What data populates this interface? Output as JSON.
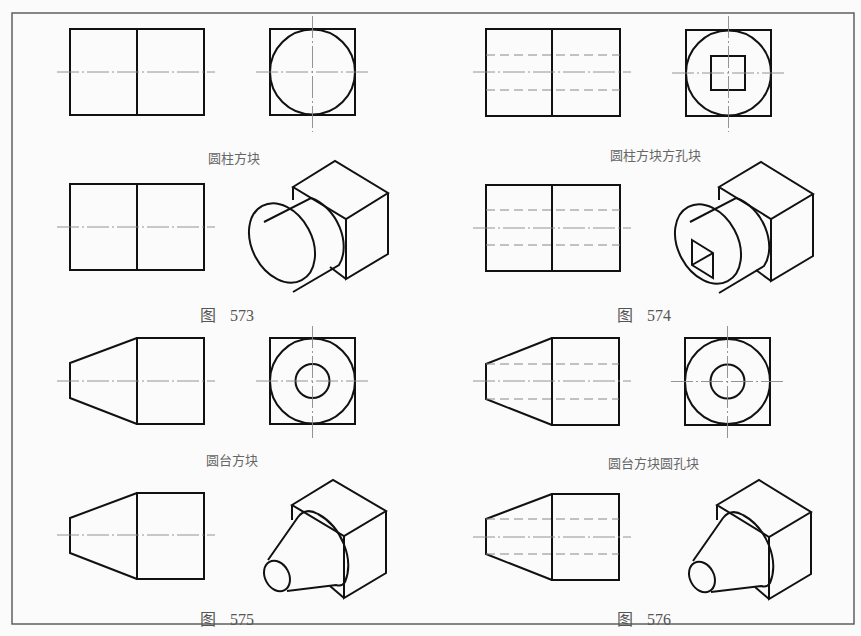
{
  "sheet": {
    "colors": {
      "object_line": "#111111",
      "center_line": "#888888",
      "hidden_line": "#888888",
      "frame": "#555555",
      "caption": "#666666"
    }
  },
  "panels": [
    {
      "id": "573-views",
      "caption": "圆柱方块"
    },
    {
      "id": "574-views",
      "caption": "圆柱方块方孔块"
    },
    {
      "id": "573-iso",
      "figure_label": "图",
      "figure_number": "573"
    },
    {
      "id": "574-iso",
      "figure_label": "图",
      "figure_number": "574"
    },
    {
      "id": "575-views",
      "caption": "圆台方块"
    },
    {
      "id": "576-views",
      "caption": "圆台方块圆孔块"
    },
    {
      "id": "575-iso",
      "figure_label": "图",
      "figure_number": "575"
    },
    {
      "id": "576-iso",
      "figure_label": "图",
      "figure_number": "576"
    }
  ]
}
